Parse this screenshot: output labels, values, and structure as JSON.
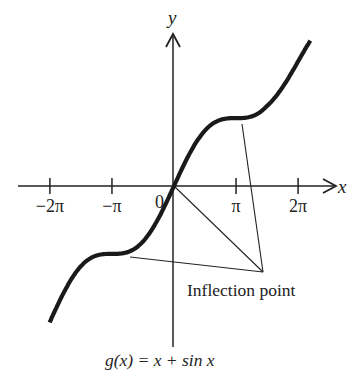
{
  "chart_data": {
    "type": "line",
    "title": "",
    "caption": "g(x) = x + sin x",
    "function": "x + sin x",
    "xlabel": "x",
    "ylabel": "y",
    "origin_label": "0",
    "x_ticks": [
      {
        "value": -6.2832,
        "label": "−2π"
      },
      {
        "value": -3.1416,
        "label": "−π"
      },
      {
        "value": 3.1416,
        "label": "π"
      },
      {
        "value": 6.2832,
        "label": "2π"
      }
    ],
    "x_range": [
      -6.3,
      6.9
    ],
    "grid": false,
    "series": [
      {
        "name": "g(x) = x + sin x",
        "x": [
          -6.28,
          -4.71,
          -3.14,
          -1.57,
          0,
          1.57,
          3.14,
          4.71,
          6.28,
          6.9
        ],
        "y": [
          -6.28,
          -3.71,
          -3.14,
          -2.57,
          0,
          2.57,
          3.14,
          3.71,
          6.28,
          7.48
        ]
      }
    ],
    "annotations": [
      {
        "text": "Inflection point",
        "points_to": [
          {
            "x": -3.1416,
            "y": -3.1416
          },
          {
            "x": 0,
            "y": 0
          },
          {
            "x": 3.1416,
            "y": 3.1416
          }
        ]
      }
    ]
  }
}
